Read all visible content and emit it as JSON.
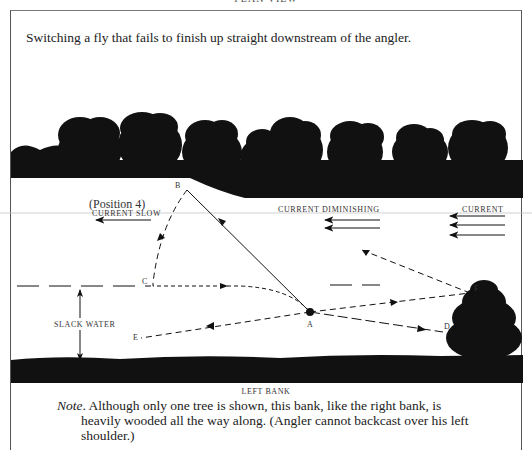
{
  "header": {
    "title_cut": "PLAN VIEW"
  },
  "caption": "Switching a fly that fails to finish up straight downstream of the angler.",
  "labels": {
    "position": "(Position 4)",
    "current_slow": "CURRENT SLOW",
    "current_diminishing": "CURRENT DIMINISHING",
    "current": "CURRENT",
    "slack_water": "SLACK WATER",
    "left_bank": "LEFT BANK"
  },
  "points": {
    "A": "A",
    "B": "B",
    "C": "C",
    "D": "D",
    "E": "E",
    "F": "F"
  },
  "note": {
    "prefix": "Note",
    "line1": ". Although only one tree is shown, this bank, like the right bank, is",
    "line2": "heavily wooded all the way along. (Angler cannot backcast over his left",
    "line3": "shoulder.)"
  },
  "colors": {
    "ink": "#111111",
    "paper": "#ffffff",
    "frame": "#555555"
  }
}
